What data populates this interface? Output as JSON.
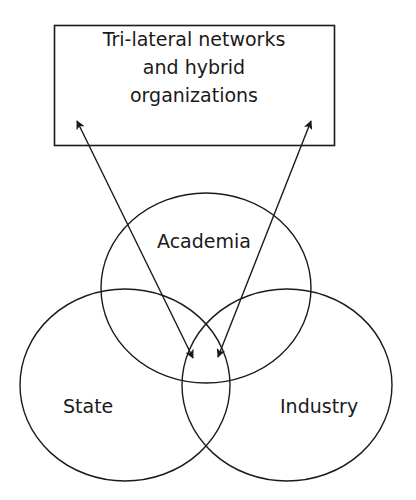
{
  "diagram": {
    "type": "venn-with-arrows",
    "box": {
      "lines": [
        "Tri-lateral networks",
        "and hybrid",
        "organizations"
      ]
    },
    "circles": [
      {
        "id": "academia",
        "label": "Academia"
      },
      {
        "id": "state",
        "label": "State"
      },
      {
        "id": "industry",
        "label": "Industry"
      }
    ],
    "arrows": [
      {
        "from": "box",
        "to": "triple-intersection",
        "bidirectional": true,
        "side": "left"
      },
      {
        "from": "box",
        "to": "triple-intersection",
        "bidirectional": true,
        "side": "right"
      }
    ],
    "colors": {
      "stroke": "#1a1a1a",
      "background": "#ffffff"
    }
  }
}
